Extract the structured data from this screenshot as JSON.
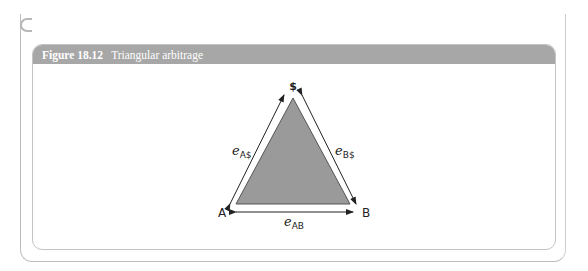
{
  "figure": {
    "number": "Figure 18.12",
    "title": "Triangular arbitrage"
  },
  "diagram": {
    "vertices": {
      "top": "$",
      "left": "A",
      "right": "B"
    },
    "edges": {
      "left": {
        "symbol": "e",
        "subscript": "A$"
      },
      "right": {
        "symbol": "e",
        "subscript": "B$"
      },
      "bottom": {
        "symbol": "e",
        "subscript": "AB"
      }
    },
    "colors": {
      "triangle_fill": "#9a9a9a",
      "triangle_stroke": "#555555",
      "header_bg": "#a7a7a7"
    }
  }
}
